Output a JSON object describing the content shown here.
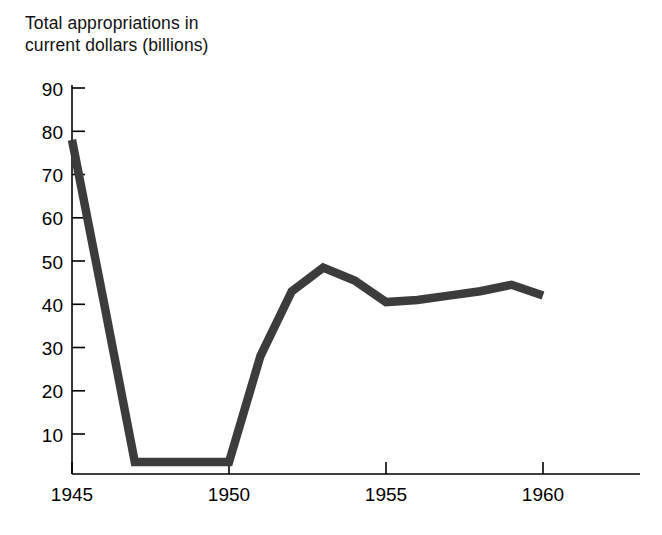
{
  "chart_data": {
    "type": "line",
    "title": "Total appropriations in\ncurrent dollars (billions)",
    "title_line1": "Total appropriations in",
    "title_line2": "current dollars (billions)",
    "xlabel": "",
    "ylabel": "Total appropriations in current dollars (billions)",
    "xlim": [
      1945,
      1961.5
    ],
    "ylim": [
      0,
      93
    ],
    "grid": false,
    "legend": null,
    "line_color": "#3c3c3c",
    "axis_color": "#000000",
    "background_color": "#ffffff",
    "x": [
      1945,
      1946,
      1947,
      1948,
      1949,
      1950,
      1951,
      1952,
      1953,
      1954,
      1955,
      1956,
      1957,
      1958,
      1959,
      1960
    ],
    "values": [
      78,
      41,
      3.5,
      3.5,
      3.5,
      3.5,
      28,
      43,
      48.5,
      45.5,
      40.5,
      41,
      42,
      43,
      44.5,
      42
    ],
    "series": [
      {
        "name": "Total appropriations",
        "values": [
          78,
          41,
          3.5,
          3.5,
          3.5,
          3.5,
          28,
          43,
          48.5,
          45.5,
          40.5,
          41,
          42,
          43,
          44.5,
          42
        ]
      }
    ],
    "yticks": [
      10,
      20,
      30,
      40,
      50,
      60,
      70,
      80,
      90
    ],
    "ytick_labels": [
      "10",
      "20",
      "30",
      "40",
      "50",
      "60",
      "70",
      "80",
      "90"
    ],
    "xticks": [
      1945,
      1950,
      1955,
      1960
    ],
    "xtick_labels": [
      "1945",
      "1950",
      "1955",
      "1960"
    ]
  }
}
